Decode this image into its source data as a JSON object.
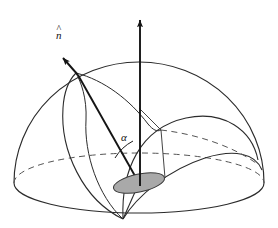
{
  "figure": {
    "background_color": "#ffffff",
    "stroke_color": "#1a1a1a",
    "thin_stroke_color": "#333333",
    "disc_fill_color": "#a9a9a9",
    "disc_stroke_color": "#3a3a3a",
    "width": 278,
    "height": 228
  },
  "labels": {
    "normal_vector": "n",
    "normal_vector_hat": "^",
    "angle": "α"
  },
  "geometry": {
    "center": {
      "x": 139,
      "y": 183
    },
    "apex_bottom": {
      "x": 123,
      "y": 219
    },
    "dome_left": {
      "x": 14,
      "y": 183
    },
    "dome_right": {
      "x": 264,
      "y": 183
    },
    "dome_top": {
      "x": 139,
      "y": 62
    },
    "axis_arrow_tip": {
      "x": 140,
      "y": 13
    },
    "normal_arrow_tip": {
      "x": 60,
      "y": 55
    },
    "normal_surface_point": {
      "x": 76,
      "y": 73
    },
    "band_vertex_right": {
      "x": 161,
      "y": 130
    },
    "equator_rx": 125,
    "equator_ry": 30,
    "disc_rx": 26,
    "disc_ry": 9,
    "disc_rotation_deg": -12
  },
  "elements": {
    "axis_arrow_name": "vertical-axis-arrow",
    "normal_arrow_name": "normal-vector-arrow",
    "angle_arc_name": "angle-arc",
    "disc_name": "shaded-disc",
    "dome_name": "hemisphere-dome-outline",
    "equator_front_name": "equator-front-arc",
    "equator_back_name": "equator-back-arc-dashed"
  }
}
